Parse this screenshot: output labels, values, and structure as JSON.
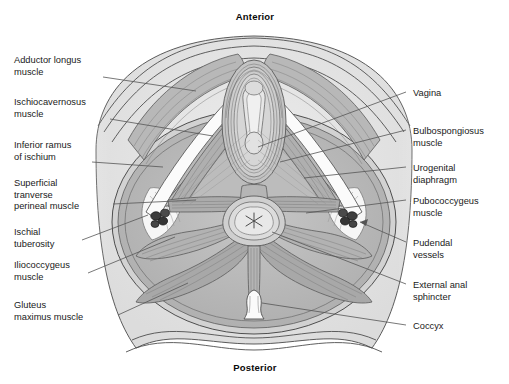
{
  "figure": {
    "orientation": {
      "anterior": "Anterior",
      "posterior": "Posterior"
    },
    "palette": {
      "page_background": "#ffffff",
      "body_fill": "#e3e3e3",
      "skin_shadow": "#d6d6d6",
      "muscle_light": "#c9c9c9",
      "muscle_mid": "#b4b4b4",
      "muscle_dark": "#9d9d9d",
      "fat_fill": "#f4f4f4",
      "vessel_dark": "#3a3a3a",
      "outline": "#4a4a4a",
      "leader_line": "#555555",
      "text": "#1a1a1a"
    },
    "labels_left": [
      {
        "id": "adductor-longus",
        "text": "Adductor longus\nmuscle",
        "x": 14,
        "y": 55,
        "anchor_x": 103,
        "anchor_y": 77,
        "tip_x": 196,
        "tip_y": 91
      },
      {
        "id": "ischiocavernosus",
        "text": "Ischiocavernosus\nmuscle",
        "x": 14,
        "y": 97,
        "anchor_x": 110,
        "anchor_y": 119,
        "tip_x": 213,
        "tip_y": 136
      },
      {
        "id": "inferior-ramus-ischium",
        "text": "Inferior ramus\nof ischium",
        "x": 14,
        "y": 140,
        "anchor_x": 92,
        "anchor_y": 162,
        "tip_x": 163,
        "tip_y": 167
      },
      {
        "id": "superficial-transverse",
        "text": "Superficial\ntranverse\nperineal muscle",
        "x": 14,
        "y": 178,
        "anchor_x": 113,
        "anchor_y": 204,
        "tip_x": 196,
        "tip_y": 200
      },
      {
        "id": "ischial-tuberosity",
        "text": "Ischial\ntuberosity",
        "x": 14,
        "y": 227,
        "anchor_x": 82,
        "anchor_y": 240,
        "tip_x": 148,
        "tip_y": 215
      },
      {
        "id": "iliococcygeus",
        "text": "Iliococcygeus\nmuscle",
        "x": 14,
        "y": 260,
        "anchor_x": 88,
        "anchor_y": 273,
        "tip_x": 175,
        "tip_y": 237
      },
      {
        "id": "gluteus-maximus",
        "text": "Gluteus\nmaximus muscle",
        "x": 14,
        "y": 300,
        "anchor_x": 118,
        "anchor_y": 315,
        "tip_x": 188,
        "tip_y": 283
      }
    ],
    "labels_right": [
      {
        "id": "vagina",
        "text": "Vagina",
        "x": 413,
        "y": 88,
        "anchor_x": 406,
        "anchor_y": 92,
        "tip_x": 258,
        "tip_y": 147
      },
      {
        "id": "bulbospongiosus",
        "text": "Bulbospongiosus\nmuscle",
        "x": 413,
        "y": 126,
        "anchor_x": 406,
        "anchor_y": 130,
        "tip_x": 280,
        "tip_y": 162
      },
      {
        "id": "urogenital-diaphragm",
        "text": "Urogenital\ndiaphragm",
        "x": 413,
        "y": 163,
        "anchor_x": 406,
        "anchor_y": 167,
        "tip_x": 304,
        "tip_y": 178
      },
      {
        "id": "pubococcygeus",
        "text": "Pubococcygeus\nmuscle",
        "x": 413,
        "y": 196,
        "anchor_x": 406,
        "anchor_y": 200,
        "tip_x": 306,
        "tip_y": 213
      },
      {
        "id": "pudendal-vessels",
        "text": "Pudendal\nvessels",
        "x": 413,
        "y": 238,
        "anchor_x": 406,
        "anchor_y": 242,
        "tip_x": 352,
        "tip_y": 221
      },
      {
        "id": "external-anal-sphincter",
        "text": "External anal\nsphincter",
        "x": 413,
        "y": 280,
        "anchor_x": 406,
        "anchor_y": 284,
        "tip_x": 272,
        "tip_y": 232
      },
      {
        "id": "coccyx",
        "text": "Coccyx",
        "x": 413,
        "y": 321,
        "anchor_x": 406,
        "anchor_y": 325,
        "tip_x": 262,
        "tip_y": 303
      }
    ],
    "structures": [
      "thigh-left",
      "thigh-right",
      "perineal-body",
      "anus",
      "vaginal-opening",
      "coccyx-bone",
      "pudendal-vessel-cluster-left",
      "pudendal-vessel-cluster-right",
      "levator-ani",
      "gluteal-mass"
    ]
  }
}
